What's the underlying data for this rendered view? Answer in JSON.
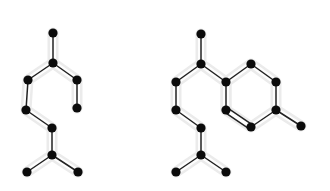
{
  "figure": {
    "title": "Two molecular graphs with a highlighted common subgraph",
    "background_color": "#ffffff",
    "node_color": "#0b0b0b",
    "edge_color": "#222222",
    "halo_color": "#ebebeb",
    "node_radius": 4.6,
    "edge_width": 1.5,
    "halo_width": 11,
    "width": 330,
    "height": 191
  },
  "graphs": [
    {
      "id": "graph-left",
      "label": "Left graph",
      "node_count": 8,
      "edge_count": 7,
      "nodes": [
        {
          "id": "L0",
          "name": "top-terminal",
          "x": 53,
          "y": 33,
          "highlighted": true
        },
        {
          "id": "L1",
          "name": "upper-branch",
          "x": 53,
          "y": 63,
          "highlighted": true
        },
        {
          "id": "L2",
          "name": "upper-left",
          "x": 28,
          "y": 80,
          "highlighted": true
        },
        {
          "id": "L3",
          "name": "upper-right",
          "x": 77,
          "y": 80,
          "highlighted": true
        },
        {
          "id": "L4",
          "name": "right-terminal",
          "x": 77,
          "y": 108,
          "highlighted": true
        },
        {
          "id": "L5",
          "name": "mid-left",
          "x": 26,
          "y": 110,
          "highlighted": true
        },
        {
          "id": "L6",
          "name": "mid-center",
          "x": 52,
          "y": 128,
          "highlighted": true
        },
        {
          "id": "L7",
          "name": "lower-branch",
          "x": 52,
          "y": 155,
          "highlighted": true
        },
        {
          "id": "L8",
          "name": "bottom-left-terminal",
          "x": 27,
          "y": 172,
          "highlighted": true
        },
        {
          "id": "L9",
          "name": "bottom-right-terminal",
          "x": 78,
          "y": 172,
          "highlighted": true
        }
      ],
      "edges": [
        {
          "from": "L0",
          "to": "L1",
          "order": 1
        },
        {
          "from": "L1",
          "to": "L2",
          "order": 1
        },
        {
          "from": "L1",
          "to": "L3",
          "order": 1
        },
        {
          "from": "L3",
          "to": "L4",
          "order": 1
        },
        {
          "from": "L2",
          "to": "L5",
          "order": 1
        },
        {
          "from": "L5",
          "to": "L6",
          "order": 1
        },
        {
          "from": "L6",
          "to": "L7",
          "order": 1
        },
        {
          "from": "L7",
          "to": "L8",
          "order": 1
        },
        {
          "from": "L7",
          "to": "L9",
          "order": 1
        }
      ]
    },
    {
      "id": "graph-right",
      "label": "Right graph",
      "node_count": 15,
      "edge_count": 16,
      "nodes": [
        {
          "id": "R0",
          "name": "top-terminal",
          "x": 201,
          "y": 34,
          "highlighted": true
        },
        {
          "id": "R1",
          "name": "upper-branch",
          "x": 201,
          "y": 64,
          "highlighted": true
        },
        {
          "id": "R2",
          "name": "upper-left",
          "x": 176,
          "y": 82,
          "highlighted": true
        },
        {
          "id": "R3",
          "name": "ring-attach",
          "x": 226,
          "y": 82,
          "highlighted": true
        },
        {
          "id": "R4",
          "name": "ring-top",
          "x": 251,
          "y": 64,
          "highlighted": false
        },
        {
          "id": "R5",
          "name": "ring-upper-right",
          "x": 276,
          "y": 82,
          "highlighted": false
        },
        {
          "id": "R6",
          "name": "ring-lower-right",
          "x": 276,
          "y": 110,
          "highlighted": false
        },
        {
          "id": "R7",
          "name": "ring-bottom",
          "x": 251,
          "y": 127,
          "highlighted": false
        },
        {
          "id": "R8",
          "name": "ring-lower-left",
          "x": 226,
          "y": 110,
          "highlighted": true
        },
        {
          "id": "R9",
          "name": "ring-side-terminal",
          "x": 301,
          "y": 126,
          "highlighted": false
        },
        {
          "id": "R10",
          "name": "mid-left",
          "x": 176,
          "y": 110,
          "highlighted": true
        },
        {
          "id": "R11",
          "name": "mid-center",
          "x": 201,
          "y": 128,
          "highlighted": true
        },
        {
          "id": "R12",
          "name": "lower-branch",
          "x": 201,
          "y": 155,
          "highlighted": true
        },
        {
          "id": "R13",
          "name": "bottom-left-terminal",
          "x": 176,
          "y": 172,
          "highlighted": true
        },
        {
          "id": "R14",
          "name": "bottom-right-terminal",
          "x": 226,
          "y": 172,
          "highlighted": true
        }
      ],
      "edges": [
        {
          "from": "R0",
          "to": "R1",
          "order": 1
        },
        {
          "from": "R1",
          "to": "R2",
          "order": 1
        },
        {
          "from": "R1",
          "to": "R3",
          "order": 1
        },
        {
          "from": "R3",
          "to": "R4",
          "order": 1
        },
        {
          "from": "R4",
          "to": "R5",
          "order": 1
        },
        {
          "from": "R5",
          "to": "R6",
          "order": 1
        },
        {
          "from": "R6",
          "to": "R7",
          "order": 1
        },
        {
          "from": "R7",
          "to": "R8",
          "order": 2
        },
        {
          "from": "R8",
          "to": "R3",
          "order": 1
        },
        {
          "from": "R6",
          "to": "R9",
          "order": 1
        },
        {
          "from": "R2",
          "to": "R10",
          "order": 1
        },
        {
          "from": "R10",
          "to": "R11",
          "order": 1
        },
        {
          "from": "R11",
          "to": "R12",
          "order": 1
        },
        {
          "from": "R12",
          "to": "R13",
          "order": 1
        },
        {
          "from": "R12",
          "to": "R14",
          "order": 1
        }
      ]
    }
  ],
  "halos": [
    {
      "id": "halo-left",
      "name": "common-subgraph-highlight-left",
      "path": "M 53 33 L 53 63 L 28 80 L 26 110 L 52 128 L 52 155 L 27 172 M 52 155 L 78 172 M 53 63 L 77 80 L 77 108"
    },
    {
      "id": "halo-right",
      "name": "common-subgraph-highlight-right",
      "path": "M 201 34 L 201 64 L 176 82 L 176 110 L 201 128 L 201 155 L 176 172 M 201 155 L 226 172 M 201 64 L 226 82 L 226 110"
    },
    {
      "id": "halo-right-ring",
      "name": "common-subgraph-highlight-right-ring",
      "path": "M 226 82 L 251 64 L 276 82 L 276 110 L 251 127 L 226 110 Z M 276 110 L 301 126"
    }
  ]
}
